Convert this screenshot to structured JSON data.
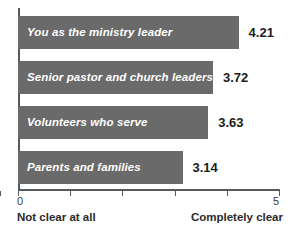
{
  "chart_data": {
    "type": "bar",
    "orientation": "horizontal",
    "title": "",
    "xlabel": "",
    "ylabel": "",
    "xlim": [
      0,
      5
    ],
    "xticks": [
      0,
      1,
      2,
      3,
      4,
      5
    ],
    "xtick_labels_shown": [
      "0",
      "5"
    ],
    "grid": false,
    "legend": false,
    "categories": [
      "You as the ministry leader",
      "Senior pastor and church leaders",
      "Volunteers who serve",
      "Parents and families"
    ],
    "values": [
      4.21,
      3.72,
      3.63,
      3.14
    ],
    "value_labels": [
      "4.21",
      "3.72",
      "3.63",
      "3.14"
    ],
    "scale_anchor_left": "Not clear at all",
    "scale_anchor_right": "Completely clear",
    "axis_min_label": "0",
    "axis_max_label": "5",
    "colors": {
      "bar_fill": "#6a6a6a",
      "bar_label_text": "#ffffff",
      "value_text": "#1c1c1c",
      "axis_line": "#555a5e",
      "caption_text": "#2b2b2b",
      "background": "#ffffff"
    }
  }
}
